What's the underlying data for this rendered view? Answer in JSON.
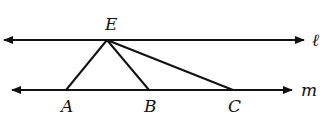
{
  "diagram": {
    "lines": [
      {
        "name": "l",
        "label": "ℓ",
        "y": 40,
        "x1": 3,
        "x2": 306
      },
      {
        "name": "m",
        "label": "m",
        "y": 90,
        "x1": 12,
        "x2": 293
      }
    ],
    "points": {
      "E": {
        "label": "E",
        "x": 107,
        "y": 40
      },
      "A": {
        "label": "A",
        "x": 66,
        "y": 90
      },
      "B": {
        "label": "B",
        "x": 149,
        "y": 90
      },
      "C": {
        "label": "C",
        "x": 233,
        "y": 90
      }
    },
    "segments": [
      "EA",
      "EB",
      "EC"
    ],
    "stroke_color": "#111111"
  }
}
